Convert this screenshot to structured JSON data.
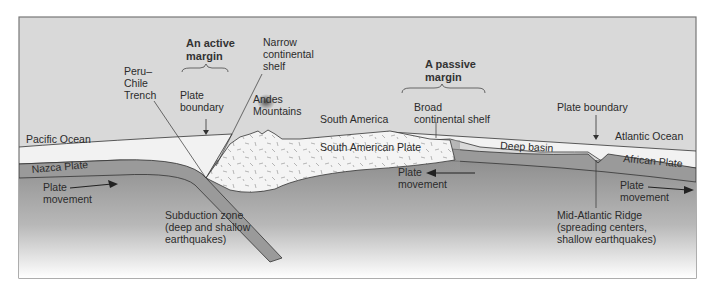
{
  "diagram": {
    "colors": {
      "sky": "#d9d9d9",
      "ocean_water": "#f2f2f2",
      "oceanic_plate": "#9a9a9a",
      "continental_crust": "#f4f4f4",
      "mantle_top": "#8e8e8e",
      "mantle_bottom": "#ffffff",
      "line": "#333333",
      "frame": "#777777"
    },
    "headings": {
      "active_margin": [
        "An active",
        "margin"
      ],
      "passive_margin": [
        "A passive",
        "margin"
      ]
    },
    "labels": {
      "peru_chile_trench": [
        "Peru–",
        "Chile",
        "Trench"
      ],
      "plate_boundary_left": [
        "Plate",
        "boundary"
      ],
      "narrow_shelf": [
        "Narrow",
        "continental",
        "shelf"
      ],
      "andes": [
        "Andes",
        "Mountains"
      ],
      "south_america": "South America",
      "broad_shelf": [
        "Broad",
        "continental shelf"
      ],
      "plate_boundary_right": "Plate boundary",
      "pacific_ocean": "Pacific Ocean",
      "atlantic_ocean": "Atlantic Ocean",
      "deep_basin": "Deep basin",
      "nazca_plate": "Nazca Plate",
      "south_american_plate": "South American Plate",
      "african_plate": "African Plate",
      "plate_movement_left": [
        "Plate",
        "movement"
      ],
      "plate_movement_center": [
        "Plate",
        "movement"
      ],
      "plate_movement_right": [
        "Plate",
        "movement"
      ],
      "subduction_zone": [
        "Subduction zone",
        "(deep and shallow",
        "earthquakes)"
      ],
      "mid_atlantic_ridge": [
        "Mid-Atlantic Ridge",
        "(spreading centers,",
        "shallow earthquakes)"
      ]
    },
    "plate_movement_directions": {
      "nazca": "right",
      "south_american": "left",
      "african": "right"
    }
  }
}
